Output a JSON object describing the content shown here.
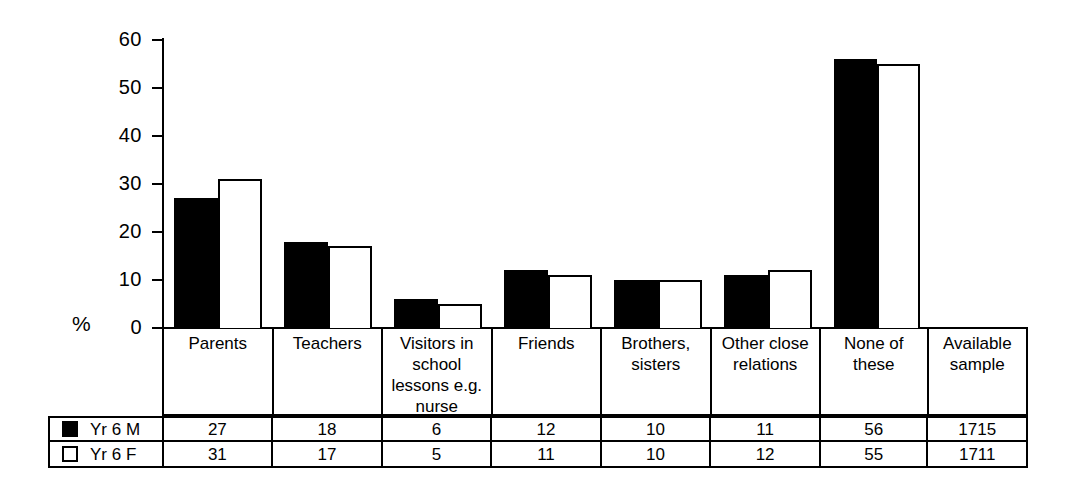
{
  "chart_data": {
    "type": "bar",
    "title": "",
    "xlabel": "",
    "ylabel": "%",
    "ylim": [
      0,
      60
    ],
    "yticks": [
      0,
      10,
      20,
      30,
      40,
      50,
      60
    ],
    "grid": false,
    "legend_position": "bottom-table",
    "categories": [
      "Parents",
      "Teachers",
      "Visitors in school lessons e.g. nurse",
      "Friends",
      "Brothers, sisters",
      "Other close relations",
      "None of these",
      "Available sample"
    ],
    "series": [
      {
        "name": "Yr 6 M",
        "values": [
          27,
          18,
          6,
          12,
          10,
          11,
          56,
          1715
        ],
        "color": "#000000",
        "style": "filled"
      },
      {
        "name": "Yr 6 F",
        "values": [
          31,
          17,
          5,
          11,
          10,
          12,
          55,
          1711
        ],
        "color": "#ffffff",
        "style": "outlined"
      }
    ],
    "plotted_categories": [
      "Parents",
      "Teachers",
      "Visitors in school lessons e.g. nurse",
      "Friends",
      "Brothers, sisters",
      "Other close relations",
      "None of these"
    ],
    "note": "Last column 'Available sample' reports sample sizes and is not drawn as bars"
  },
  "axis": {
    "y_label": "%",
    "ticks": [
      "60",
      "50",
      "40",
      "30",
      "20",
      "10",
      "0"
    ]
  },
  "categories": [
    {
      "lines": [
        "Parents"
      ]
    },
    {
      "lines": [
        "Teachers"
      ]
    },
    {
      "lines": [
        "Visitors in",
        "school",
        "lessons e.g.",
        "nurse"
      ]
    },
    {
      "lines": [
        "Friends"
      ]
    },
    {
      "lines": [
        "Brothers,",
        "sisters"
      ]
    },
    {
      "lines": [
        "Other close",
        "relations"
      ]
    },
    {
      "lines": [
        "None of these"
      ]
    },
    {
      "lines": [
        "Available",
        "sample"
      ]
    }
  ],
  "table": {
    "rows": [
      {
        "legend": "Yr 6 M",
        "swatch": "filled-square-icon",
        "values": [
          "27",
          "18",
          "6",
          "12",
          "10",
          "11",
          "56",
          "1715"
        ]
      },
      {
        "legend": "Yr 6 F",
        "swatch": "open-square-icon",
        "values": [
          "31",
          "17",
          "5",
          "11",
          "10",
          "12",
          "55",
          "1711"
        ]
      }
    ]
  }
}
